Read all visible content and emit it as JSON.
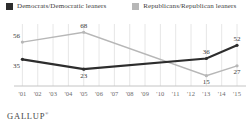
{
  "footer": {
    "brand": "GALLUP",
    "trademark": "®"
  },
  "chart_data": {
    "type": "line",
    "title": "",
    "xlabel": "",
    "ylabel": "",
    "x_tick_labels": [
      "'01",
      "'02",
      "'03",
      "'04",
      "'05",
      "'06",
      "'07",
      "'08",
      "'09",
      "'10",
      "'11",
      "'12",
      "'13",
      "'14",
      "'15"
    ],
    "x_years": [
      2001,
      2002,
      2003,
      2004,
      2005,
      2006,
      2007,
      2008,
      2009,
      2010,
      2011,
      2012,
      2013,
      2014,
      2015
    ],
    "ylim": [
      0,
      80
    ],
    "grid": "vertical",
    "legend_position": "top",
    "source": "GALLUP",
    "series": [
      {
        "name": "Democrats/Democratic leaners",
        "color": "#2d2d2d",
        "points": [
          {
            "year": 2001,
            "value": 35,
            "label_pos": "below"
          },
          {
            "year": 2005,
            "value": 23,
            "label_pos": "below"
          },
          {
            "year": 2013,
            "value": 36,
            "label_pos": "above"
          },
          {
            "year": 2015,
            "value": 52,
            "label_pos": "above"
          }
        ]
      },
      {
        "name": "Republicans/Republican leaners",
        "color": "#b7b7b7",
        "points": [
          {
            "year": 2001,
            "value": 56,
            "label_pos": "above"
          },
          {
            "year": 2005,
            "value": 68,
            "label_pos": "above"
          },
          {
            "year": 2013,
            "value": 15,
            "label_pos": "below"
          },
          {
            "year": 2015,
            "value": 27,
            "label_pos": "below"
          }
        ]
      }
    ]
  }
}
